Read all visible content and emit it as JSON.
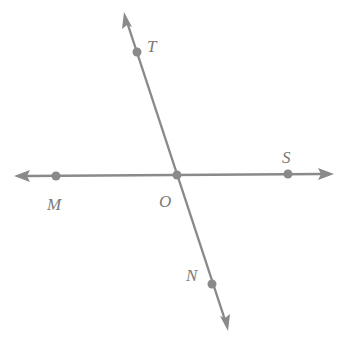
{
  "diagram": {
    "type": "intersecting-lines",
    "colors": {
      "stroke": "#8a8a8a",
      "label": "#7a7a7a",
      "background": "#ffffff"
    },
    "lines": [
      {
        "name": "line-MS",
        "from": [
          15,
          176
        ],
        "to": [
          333,
          174
        ],
        "arrows": "both"
      },
      {
        "name": "line-TN",
        "from": [
          124,
          12
        ],
        "to": [
          228,
          330
        ],
        "arrows": "both"
      }
    ],
    "points": [
      {
        "id": "T",
        "label": "T",
        "x": 137,
        "y": 52,
        "label_x": 147,
        "label_y": 52
      },
      {
        "id": "M",
        "label": "M",
        "x": 56,
        "y": 176,
        "label_x": 47,
        "label_y": 210
      },
      {
        "id": "O",
        "label": "O",
        "x": 177,
        "y": 175,
        "label_x": 159,
        "label_y": 207
      },
      {
        "id": "S",
        "label": "S",
        "x": 288,
        "y": 174,
        "label_x": 282,
        "label_y": 163
      },
      {
        "id": "N",
        "label": "N",
        "x": 212,
        "y": 284,
        "label_x": 186,
        "label_y": 281
      }
    ]
  }
}
